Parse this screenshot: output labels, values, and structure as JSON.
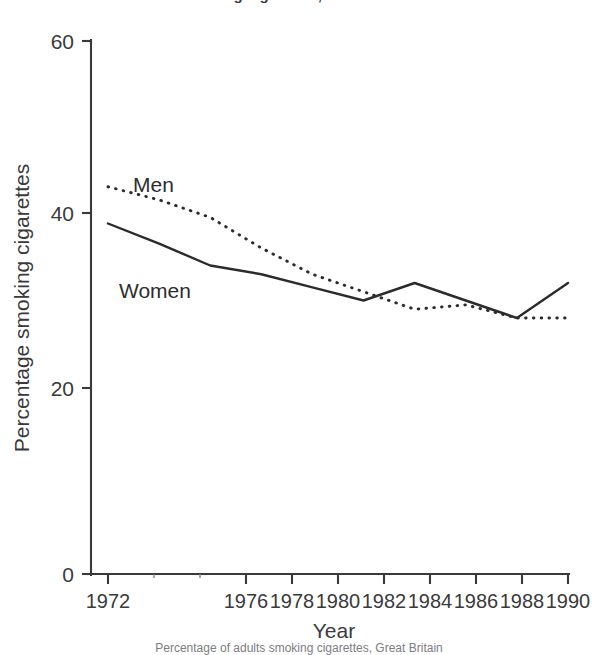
{
  "figure": {
    "title_clipped": "smoking cigarettes, Great Britain",
    "caption_clipped": "Percentage of adults smoking cigarettes, Great Britain"
  },
  "chart_data": {
    "type": "line",
    "title": "",
    "xlabel": "Year",
    "ylabel": "Percentage smoking cigarettes",
    "x": [
      1972,
      1974,
      1976,
      1978,
      1980,
      1982,
      1984,
      1986,
      1988,
      1990
    ],
    "xlim": [
      1972,
      1990
    ],
    "ylim": [
      0,
      60
    ],
    "yticks": [
      0,
      20,
      40,
      60
    ],
    "ytick_labels": [
      "0",
      "20",
      "40",
      "60"
    ],
    "xticks": [
      1972,
      1974,
      1976,
      1978,
      1980,
      1982,
      1984,
      1986,
      1988,
      1990
    ],
    "xtick_labels": [
      "1972",
      "",
      "1976",
      "1978",
      "1980",
      "1982",
      "1984",
      "1986",
      "1988",
      "1990"
    ],
    "grid": false,
    "legend_position": "inline-annotation",
    "series": [
      {
        "name": "Men",
        "style": "dotted",
        "label_x": 1973.3,
        "label_y": 45.5,
        "values": [
          43.0,
          41.5,
          39.5,
          36.0,
          33.0,
          31.0,
          29.0,
          29.5,
          28.0,
          28.0
        ]
      },
      {
        "name": "Women",
        "style": "solid",
        "label_x": 1972.6,
        "label_y": 36.5,
        "values": [
          38.8,
          36.5,
          34.0,
          33.0,
          31.5,
          30.0,
          32.0,
          30.0,
          28.0,
          32.0
        ]
      }
    ],
    "annotations": [
      {
        "text": "Men",
        "x": 1973.3,
        "y": 45.5
      },
      {
        "text": "Women",
        "x": 1972.6,
        "y": 36.5
      }
    ]
  }
}
